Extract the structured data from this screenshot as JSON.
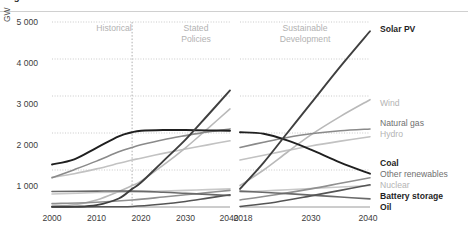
{
  "figure": {
    "title_fragment": "Figure",
    "unit_label": "GW"
  },
  "axis": {
    "y_ticks": [
      "5 000",
      "4 000",
      "3 000",
      "2 000",
      "1 000"
    ],
    "x_ticks_left": [
      "2000",
      "2010",
      "2020",
      "2030",
      "2040"
    ],
    "x_ticks_right": [
      "2018",
      "2030",
      "2040"
    ]
  },
  "bands": [
    {
      "name": "historical",
      "line1": "Historical",
      "line2": ""
    },
    {
      "name": "stated-policies",
      "line1": "Stated",
      "line2": "Policies"
    },
    {
      "name": "sustainable-development",
      "line1": "Sustainable",
      "line2": "Development"
    }
  ],
  "legend": [
    {
      "key": "solar_pv",
      "label": "Solar PV",
      "style": "lg-bold",
      "color": "#3f3f3f",
      "top": 24
    },
    {
      "key": "wind",
      "label": "Wind",
      "style": "lg-light",
      "color": "#b9b9b9",
      "top": 98
    },
    {
      "key": "natural_gas",
      "label": "Natural gas",
      "style": "lg-mid",
      "color": "#8a8a8a",
      "top": 118
    },
    {
      "key": "hydro",
      "label": "Hydro",
      "style": "lg-light",
      "color": "#c2c2c2",
      "top": 129
    },
    {
      "key": "coal",
      "label": "Coal",
      "style": "lg-bold",
      "color": "#1f1f1f",
      "top": 158
    },
    {
      "key": "other_renewables",
      "label": "Other renewables",
      "style": "lg-mid",
      "color": "#909090",
      "top": 169
    },
    {
      "key": "nuclear",
      "label": "Nuclear",
      "style": "lg-light",
      "color": "#c8c8c8",
      "top": 180
    },
    {
      "key": "battery_storage",
      "label": "Battery storage",
      "style": "lg-bold",
      "color": "#555555",
      "top": 191
    },
    {
      "key": "oil",
      "label": "Oil",
      "style": "lg-bold",
      "color": "#6a6a6a",
      "top": 202
    }
  ],
  "chart_data": {
    "type": "line",
    "xlabel": "",
    "ylabel": "GW",
    "ylim": [
      0,
      5000
    ],
    "y_gridlines": [
      1000,
      2000,
      3000,
      4000,
      5000
    ],
    "grid": true,
    "legend_position": "right-inline",
    "panels": [
      {
        "name": "Historical and Stated Policies",
        "xlim": [
          2000,
          2040
        ],
        "x_ticks": [
          2000,
          2010,
          2020,
          2030,
          2040
        ],
        "divider_year": 2018,
        "bands": [
          "Historical",
          "Stated Policies"
        ],
        "series": [
          {
            "name": "Coal",
            "color": "#1f1f1f",
            "x": [
              2000,
              2005,
              2010,
              2015,
              2018,
              2020,
              2025,
              2030,
              2035,
              2040
            ],
            "values": [
              1150,
              1290,
              1600,
              1910,
              2020,
              2060,
              2080,
              2080,
              2070,
              2060
            ]
          },
          {
            "name": "Natural gas",
            "color": "#8a8a8a",
            "x": [
              2000,
              2005,
              2010,
              2015,
              2018,
              2020,
              2025,
              2030,
              2035,
              2040
            ],
            "values": [
              790,
              1010,
              1240,
              1490,
              1610,
              1680,
              1820,
              1930,
              2030,
              2110
            ]
          },
          {
            "name": "Hydro",
            "color": "#c2c2c2",
            "x": [
              2000,
              2005,
              2010,
              2015,
              2018,
              2020,
              2025,
              2030,
              2035,
              2040
            ],
            "values": [
              800,
              900,
              1030,
              1180,
              1270,
              1320,
              1450,
              1570,
              1680,
              1790
            ]
          },
          {
            "name": "Solar PV",
            "color": "#3f3f3f",
            "x": [
              2000,
              2005,
              2010,
              2015,
              2018,
              2020,
              2025,
              2030,
              2035,
              2040
            ],
            "values": [
              5,
              10,
              50,
              230,
              490,
              660,
              1240,
              1820,
              2480,
              3150
            ]
          },
          {
            "name": "Wind",
            "color": "#b9b9b9",
            "x": [
              2000,
              2005,
              2010,
              2015,
              2018,
              2020,
              2025,
              2030,
              2035,
              2040
            ],
            "values": [
              20,
              60,
              190,
              420,
              580,
              700,
              1130,
              1600,
              2120,
              2650
            ]
          },
          {
            "name": "Oil",
            "color": "#6a6a6a",
            "x": [
              2000,
              2010,
              2018,
              2025,
              2030,
              2035,
              2040
            ],
            "values": [
              420,
              430,
              430,
              400,
              370,
              340,
              310
            ]
          },
          {
            "name": "Nuclear",
            "color": "#c8c8c8",
            "x": [
              2000,
              2010,
              2018,
              2025,
              2030,
              2035,
              2040
            ],
            "values": [
              350,
              390,
              410,
              430,
              450,
              470,
              490
            ]
          },
          {
            "name": "Other renewables",
            "color": "#909090",
            "x": [
              2000,
              2010,
              2018,
              2025,
              2030,
              2035,
              2040
            ],
            "values": [
              90,
              130,
              190,
              270,
              330,
              390,
              450
            ]
          },
          {
            "name": "Battery storage",
            "color": "#555555",
            "x": [
              2000,
              2010,
              2018,
              2025,
              2030,
              2035,
              2040
            ],
            "values": [
              2,
              5,
              15,
              80,
              150,
              240,
              330
            ]
          }
        ]
      },
      {
        "name": "Sustainable Development",
        "xlim": [
          2018,
          2040
        ],
        "x_ticks": [
          2018,
          2030,
          2040
        ],
        "bands": [
          "Sustainable Development"
        ],
        "series": [
          {
            "name": "Solar PV",
            "color": "#3f3f3f",
            "x": [
              2018,
              2022,
              2026,
              2030,
              2035,
              2040
            ],
            "values": [
              490,
              1200,
              2000,
              2800,
              3800,
              4750
            ]
          },
          {
            "name": "Wind",
            "color": "#b9b9b9",
            "x": [
              2018,
              2022,
              2026,
              2030,
              2035,
              2040
            ],
            "values": [
              580,
              1000,
              1480,
              1950,
              2450,
              2900
            ]
          },
          {
            "name": "Natural gas",
            "color": "#8a8a8a",
            "x": [
              2018,
              2022,
              2026,
              2030,
              2035,
              2040
            ],
            "values": [
              1610,
              1750,
              1880,
              1980,
              2060,
              2110
            ]
          },
          {
            "name": "Hydro",
            "color": "#c2c2c2",
            "x": [
              2018,
              2022,
              2026,
              2030,
              2035,
              2040
            ],
            "values": [
              1270,
              1400,
              1530,
              1650,
              1780,
              1900
            ]
          },
          {
            "name": "Coal",
            "color": "#1f1f1f",
            "x": [
              2018,
              2022,
              2026,
              2030,
              2035,
              2040
            ],
            "values": [
              2020,
              1980,
              1800,
              1550,
              1200,
              900
            ]
          },
          {
            "name": "Other renewables",
            "color": "#909090",
            "x": [
              2018,
              2024,
              2030,
              2035,
              2040
            ],
            "values": [
              190,
              330,
              490,
              640,
              790
            ]
          },
          {
            "name": "Nuclear",
            "color": "#c8c8c8",
            "x": [
              2018,
              2024,
              2030,
              2035,
              2040
            ],
            "values": [
              410,
              450,
              500,
              540,
              580
            ]
          },
          {
            "name": "Battery storage",
            "color": "#555555",
            "x": [
              2018,
              2024,
              2030,
              2035,
              2040
            ],
            "values": [
              15,
              130,
              300,
              450,
              600
            ]
          },
          {
            "name": "Oil",
            "color": "#6a6a6a",
            "x": [
              2018,
              2024,
              2030,
              2035,
              2040
            ],
            "values": [
              430,
              380,
              320,
              270,
              220
            ]
          }
        ]
      }
    ]
  }
}
